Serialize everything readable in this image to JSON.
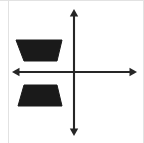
{
  "figure": {
    "canvas": {
      "width": 144,
      "height": 143,
      "background_color": "#ffffff"
    },
    "border": {
      "color": "#e2e2e2",
      "left_x": 8,
      "right_x": 143,
      "top_y": 0
    }
  },
  "axes": {
    "color": "#262626",
    "stroke_width": 2.1,
    "origin": {
      "x": 74,
      "y": 72
    },
    "x_axis": {
      "name": "horizontal-axis",
      "y": 72,
      "start_x": 12,
      "end_x": 137,
      "arrow_left": true,
      "arrow_right": true
    },
    "y_axis": {
      "name": "vertical-axis",
      "x": 74,
      "start_y": 9,
      "end_y": 136,
      "arrow_up": true,
      "arrow_down": true
    },
    "arrow_half_width": 4.2,
    "arrow_length": 7.5,
    "tick_labels": [],
    "axis_labels": []
  },
  "shapes": [
    {
      "id": "upper-trapezoid",
      "name": "Trapezoid in Quadrant II",
      "quadrant": 2,
      "fill_color": "#1a1a1a",
      "orientation": "long-side-top",
      "points": "16,40 62,40 57,61 24,61",
      "vertices": [
        {
          "x": 16,
          "y": 40
        },
        {
          "x": 62,
          "y": 40
        },
        {
          "x": 57,
          "y": 61
        },
        {
          "x": 24,
          "y": 61
        }
      ],
      "top_edge_length": 46,
      "bottom_edge_length": 33,
      "height": 21
    },
    {
      "id": "lower-trapezoid",
      "name": "Trapezoid in Quadrant III",
      "quadrant": 3,
      "fill_color": "#1a1a1a",
      "orientation": "long-side-bottom",
      "points": "24,85 57,85 62,106 18,106",
      "vertices": [
        {
          "x": 24,
          "y": 85
        },
        {
          "x": 57,
          "y": 85
        },
        {
          "x": 62,
          "y": 106
        },
        {
          "x": 18,
          "y": 106
        }
      ],
      "top_edge_length": 33,
      "bottom_edge_length": 44,
      "height": 21
    }
  ]
}
